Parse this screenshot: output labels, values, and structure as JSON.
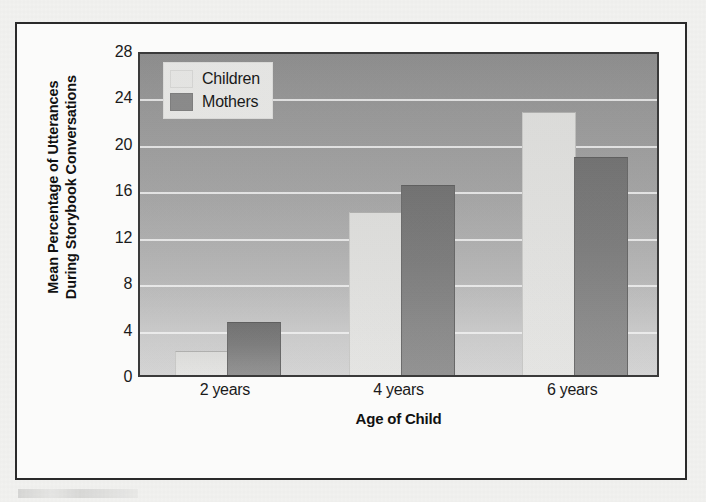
{
  "figure": {
    "background_color": "#f2f2f0",
    "border_color": "#2a2a2a"
  },
  "chart_data": {
    "type": "bar",
    "title": "",
    "xlabel": "Age of Child",
    "ylabel": "Mean Percentage of Utterances During Storybook Conversations",
    "ylabel_line1": "Mean Percentage of Utterances",
    "ylabel_line2": "During Storybook Conversations",
    "categories": [
      "2 years",
      "4 years",
      "6 years"
    ],
    "series": [
      {
        "name": "Children",
        "values": [
          2.0,
          14.0,
          22.6
        ],
        "color": "#ececea"
      },
      {
        "name": "Mothers",
        "values": [
          4.5,
          16.3,
          18.7
        ],
        "color": "#8b8b8b"
      }
    ],
    "ylim": [
      0,
      28
    ],
    "yticks": [
      0,
      4,
      8,
      12,
      16,
      20,
      24,
      28
    ],
    "ytick_labels": [
      "0",
      "4",
      "8",
      "12",
      "16",
      "20",
      "24",
      "28"
    ],
    "grid": true,
    "grid_color": "#ffffff",
    "legend_position": "top-left",
    "plot_background": "vertical-gray-gradient",
    "plot_border_color": "#3a3a3a"
  },
  "legend": {
    "entries": [
      {
        "label": "Children",
        "swatch": "light-gray-swatch"
      },
      {
        "label": "Mothers",
        "swatch": "dark-gray-swatch"
      }
    ]
  }
}
